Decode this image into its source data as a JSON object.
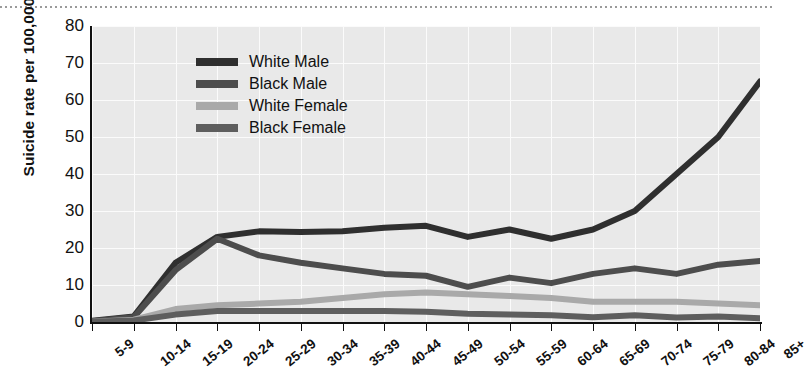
{
  "chart_data": {
    "type": "line",
    "title": "",
    "xlabel": "",
    "ylabel": "Suicide rate per 100,000",
    "ylim": [
      0,
      80
    ],
    "yticks": [
      0,
      10,
      20,
      30,
      40,
      50,
      60,
      70,
      80
    ],
    "grid": true,
    "legend_position": "upper-left-inside",
    "categories": [
      "5-9",
      "10-14",
      "15-19",
      "20-24",
      "25-29",
      "30-34",
      "35-39",
      "40-44",
      "45-49",
      "50-54",
      "55-59",
      "60-64",
      "65-69",
      "70-74",
      "75-79",
      "80-84",
      "85+"
    ],
    "series": [
      {
        "name": "White Male",
        "color": "#2f2f2f",
        "values": [
          0.3,
          1.5,
          16.0,
          23.0,
          24.5,
          24.3,
          24.5,
          25.5,
          26.0,
          23.0,
          25.0,
          22.5,
          25.0,
          30.0,
          40.0,
          50.0,
          65.0
        ]
      },
      {
        "name": "Black Male",
        "color": "#4d4d4d",
        "values": [
          0.2,
          1.3,
          14.0,
          22.5,
          18.0,
          16.0,
          14.5,
          13.0,
          12.5,
          9.5,
          12.0,
          10.5,
          13.0,
          14.5,
          13.0,
          15.5,
          16.5
        ]
      },
      {
        "name": "White Female",
        "color": "#a9a9a9",
        "values": [
          0.1,
          0.6,
          3.5,
          4.5,
          5.0,
          5.5,
          6.5,
          7.5,
          8.0,
          7.5,
          7.0,
          6.5,
          5.5,
          5.5,
          5.5,
          5.0,
          4.5
        ]
      },
      {
        "name": "Black Female",
        "color": "#5e5e5e",
        "values": [
          0.1,
          0.4,
          2.0,
          3.0,
          3.0,
          3.0,
          3.0,
          3.0,
          2.8,
          2.2,
          2.0,
          1.8,
          1.3,
          1.8,
          1.2,
          1.5,
          1.0
        ]
      }
    ]
  },
  "legend": {
    "items": [
      {
        "label": "White Male"
      },
      {
        "label": "Black Male"
      },
      {
        "label": "White Female"
      },
      {
        "label": "Black Female"
      }
    ]
  }
}
